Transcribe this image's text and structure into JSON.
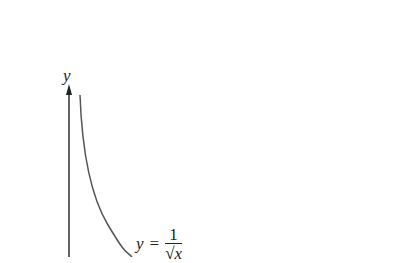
{
  "diagram": {
    "y_axis_label": "y",
    "curve_label": {
      "lhs": "y",
      "equals": "=",
      "numerator": "1",
      "denominator": "√x"
    },
    "function": "y = 1/sqrt(x)",
    "colors": {
      "axis": "#222222",
      "curve": "#555555",
      "background": "#ffffff"
    }
  }
}
